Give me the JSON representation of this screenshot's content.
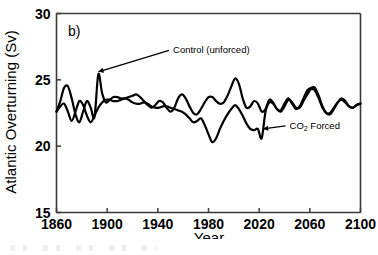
{
  "figure": {
    "panel_label": "b)",
    "background_color": "#ffffff",
    "line_color": "#000000",
    "axis_color": "#3a3a3a"
  },
  "chart_data": {
    "type": "line",
    "title": "",
    "panel": "b)",
    "xlabel": "Year",
    "ylabel": "Atlantic Overturning (Sv)",
    "xlim": [
      1860,
      2100
    ],
    "ylim": [
      15,
      30
    ],
    "xticks": [
      1860,
      1900,
      1940,
      1980,
      2020,
      2060,
      2100
    ],
    "yticks": [
      15,
      20,
      25,
      30
    ],
    "xtick_labels": [
      "1860",
      "1900",
      "1940",
      "1980",
      "2020",
      "2060",
      "2100"
    ],
    "ytick_labels": [
      "15",
      "20",
      "25",
      "30"
    ],
    "grid": false,
    "legend": "none",
    "annotations": [
      {
        "text": "Control (unforced)",
        "text_sub": "",
        "x_year": 1952,
        "y_value": 27.0,
        "arrow_to_x_year": 1893,
        "arrow_to_y_value": 25.6,
        "align": "left"
      },
      {
        "text": "CO",
        "text_sub": "2",
        "text_tail": " Forced",
        "x_year": 2044,
        "y_value": 21.3,
        "arrow_to_x_year": 2023,
        "arrow_to_y_value": 21.3,
        "align": "left"
      }
    ],
    "series": [
      {
        "name": "Control (unforced)",
        "color": "#000000",
        "x": [
          1860,
          1863,
          1866,
          1869,
          1872,
          1875,
          1878,
          1881,
          1884,
          1887,
          1890,
          1893,
          1896,
          1899,
          1902,
          1905,
          1908,
          1911,
          1914,
          1917,
          1920,
          1923,
          1926,
          1929,
          1932,
          1935,
          1938,
          1941,
          1944,
          1947,
          1950,
          1953,
          1956,
          1959,
          1962,
          1965,
          1968,
          1971,
          1974,
          1977,
          1980,
          1983,
          1986,
          1989,
          1992,
          1995,
          1998,
          2001,
          2004,
          2007,
          2010,
          2013,
          2016,
          2019,
          2022,
          2025,
          2028,
          2031,
          2034,
          2037,
          2040,
          2043,
          2046,
          2049,
          2052,
          2055,
          2058,
          2061,
          2064,
          2067,
          2070,
          2073,
          2076,
          2079,
          2082,
          2085,
          2088,
          2091,
          2094,
          2097,
          2100
        ],
        "y": [
          22.6,
          23.4,
          24.4,
          24.5,
          23.6,
          22.4,
          21.8,
          22.6,
          23.4,
          22.9,
          22.2,
          25.4,
          24.0,
          23.3,
          23.5,
          23.7,
          23.7,
          23.6,
          23.6,
          23.7,
          23.8,
          23.9,
          23.7,
          23.4,
          23.1,
          22.9,
          23.1,
          23.4,
          23.3,
          22.9,
          22.6,
          22.9,
          23.6,
          23.9,
          23.6,
          23.0,
          22.5,
          22.4,
          22.8,
          23.3,
          23.7,
          23.7,
          23.4,
          23.2,
          23.3,
          23.8,
          24.5,
          25.1,
          24.7,
          23.6,
          22.9,
          23.0,
          23.4,
          23.2,
          22.6,
          22.8,
          23.5,
          23.3,
          22.8,
          22.7,
          23.2,
          23.6,
          23.2,
          22.8,
          23.0,
          23.6,
          24.2,
          24.4,
          24.4,
          23.8,
          23.0,
          22.5,
          22.4,
          22.8,
          23.3,
          23.6,
          23.4,
          23.0,
          22.9,
          23.1,
          23.2
        ]
      },
      {
        "name": "CO2 Forced",
        "color": "#000000",
        "x": [
          1860,
          1863,
          1866,
          1869,
          1872,
          1875,
          1878,
          1881,
          1884,
          1887,
          1890,
          1893,
          1896,
          1899,
          1902,
          1905,
          1908,
          1911,
          1914,
          1917,
          1920,
          1923,
          1926,
          1929,
          1932,
          1935,
          1938,
          1941,
          1944,
          1947,
          1950,
          1953,
          1956,
          1959,
          1962,
          1965,
          1968,
          1971,
          1974,
          1977,
          1980,
          1983,
          1986,
          1989,
          1992,
          1995,
          1998,
          2001,
          2004,
          2007,
          2010,
          2013,
          2016,
          2019,
          2022,
          2025,
          2028,
          2031,
          2034,
          2037,
          2040,
          2043,
          2046,
          2049,
          2052,
          2055,
          2058,
          2061,
          2064,
          2067,
          2070,
          2073,
          2076,
          2079,
          2082,
          2085,
          2088,
          2091,
          2094,
          2097,
          2100
        ],
        "y": [
          22.6,
          23.0,
          23.2,
          22.6,
          21.9,
          22.6,
          23.4,
          23.1,
          22.3,
          21.8,
          22.3,
          22.9,
          23.3,
          23.5,
          23.5,
          23.4,
          23.4,
          23.5,
          23.6,
          23.5,
          23.3,
          23.2,
          23.2,
          23.3,
          23.2,
          23.0,
          22.9,
          22.9,
          23.0,
          23.0,
          22.9,
          22.8,
          22.7,
          22.6,
          22.4,
          22.1,
          21.8,
          21.9,
          22.1,
          21.6,
          20.9,
          20.3,
          20.6,
          21.3,
          21.9,
          22.4,
          22.8,
          23.1,
          22.8,
          22.3,
          21.7,
          21.3,
          21.2,
          21.3,
          20.6,
          22.6,
          23.3,
          23.2,
          22.8,
          22.6,
          23.0,
          23.5,
          23.3,
          22.9,
          22.9,
          23.4,
          23.9,
          24.3,
          24.2,
          23.6,
          22.9,
          22.5,
          22.5,
          22.9,
          23.3,
          23.5,
          23.3,
          23.0,
          22.9,
          23.1,
          23.2
        ]
      }
    ]
  }
}
